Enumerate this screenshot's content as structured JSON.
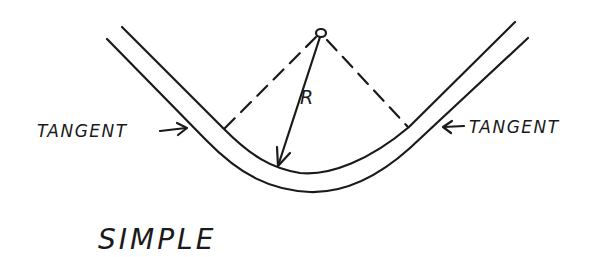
{
  "diagram": {
    "type": "simple-curve",
    "title": "SIMPLE",
    "labels": {
      "left_tangent": "TANGENT",
      "right_tangent": "TANGENT",
      "radius": "R"
    },
    "colors": {
      "ink": "#1a1a1a",
      "background": "#ffffff"
    }
  }
}
